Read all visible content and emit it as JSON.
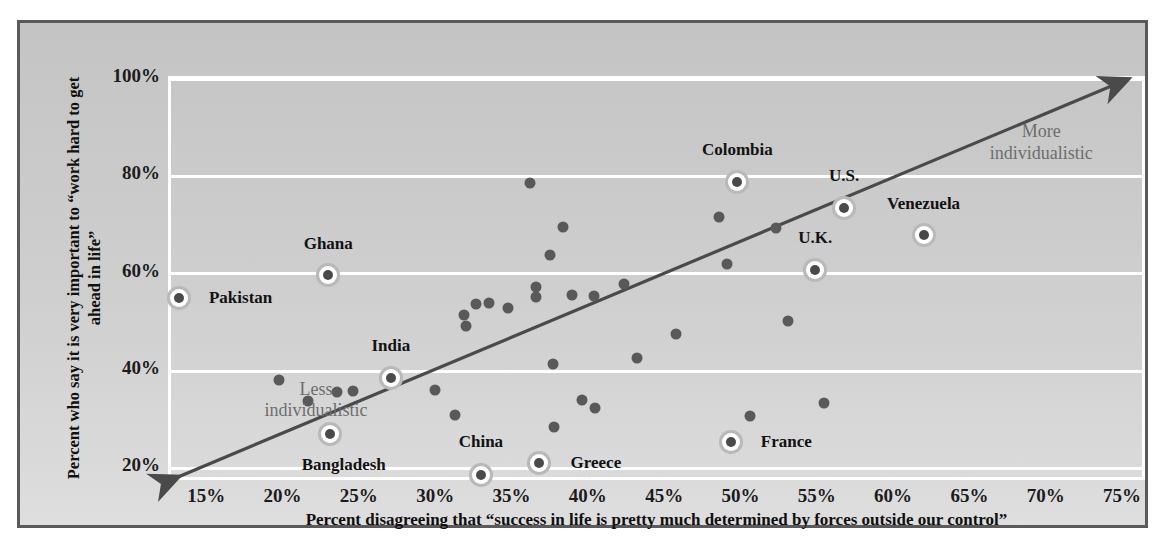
{
  "chart_data": {
    "type": "scatter",
    "title": "",
    "xlabel": "Percent disagreeing that “success in life is pretty much determined by forces outside our control”",
    "ylabel": "Percent who say it is very important to “work hard to get ahead in life”",
    "xlim": [
      12.5,
      76.5
    ],
    "ylim": [
      17.0,
      100.0
    ],
    "xticks": [
      "15%",
      "20%",
      "25%",
      "30%",
      "35%",
      "40%",
      "45%",
      "50%",
      "55%",
      "60%",
      "65%",
      "70%",
      "75%"
    ],
    "xtick_values": [
      15,
      20,
      25,
      30,
      35,
      40,
      45,
      50,
      55,
      60,
      65,
      70,
      75
    ],
    "yticks": [
      "20%",
      "40%",
      "60%",
      "80%",
      "100%"
    ],
    "ytick_values": [
      20,
      40,
      60,
      80,
      100
    ],
    "grid": "horizontal",
    "legend": "none",
    "annotations": [
      {
        "name": "less-individualistic",
        "text": "Less\nindividualistic",
        "x": 22.0,
        "y": 34.0
      },
      {
        "name": "more-individualistic",
        "text": "More\nindividualistic",
        "x": 69.5,
        "y": 87.0
      }
    ],
    "trendline": {
      "name": "diagonal-arrow",
      "x0": 13.0,
      "y0": 18.3,
      "x1": 75.2,
      "y1": 100.0,
      "arrow_start": true,
      "arrow_end": true,
      "color": "#4a4a4a"
    },
    "labeled_points": [
      {
        "label": "Pakistan",
        "x": 13.0,
        "y": 55.0,
        "label_dx": 62,
        "label_dy": 0
      },
      {
        "label": "Ghana",
        "x": 22.8,
        "y": 59.8,
        "label_dx": 0,
        "label_dy": -31
      },
      {
        "label": "Bangladesh",
        "x": 22.9,
        "y": 27.0,
        "label_dx": 14,
        "label_dy": 31
      },
      {
        "label": "India",
        "x": 26.9,
        "y": 38.6,
        "label_dx": 0,
        "label_dy": -32
      },
      {
        "label": "China",
        "x": 32.8,
        "y": 18.6,
        "label_dx": 0,
        "label_dy": -33
      },
      {
        "label": "Greece",
        "x": 36.6,
        "y": 21.2,
        "label_dx": 57,
        "label_dy": 0
      },
      {
        "label": "France",
        "x": 49.2,
        "y": 25.4,
        "label_dx": 55,
        "label_dy": 0
      },
      {
        "label": "Colombia",
        "x": 49.6,
        "y": 78.9,
        "label_dx": 0,
        "label_dy": -32
      },
      {
        "label": "U.K.",
        "x": 54.7,
        "y": 60.7,
        "label_dx": 0,
        "label_dy": -32
      },
      {
        "label": "U.S.",
        "x": 56.6,
        "y": 73.6,
        "label_dx": 0,
        "label_dy": -32
      },
      {
        "label": "Venezuela",
        "x": 61.8,
        "y": 68.0,
        "label_dx": 0,
        "label_dy": -31
      }
    ],
    "unlabeled_points": [
      {
        "x": 19.6,
        "y": 38.1
      },
      {
        "x": 21.5,
        "y": 33.9
      },
      {
        "x": 23.4,
        "y": 35.6
      },
      {
        "x": 24.4,
        "y": 35.8
      },
      {
        "x": 29.8,
        "y": 36.2
      },
      {
        "x": 31.1,
        "y": 30.9
      },
      {
        "x": 31.7,
        "y": 51.6
      },
      {
        "x": 31.8,
        "y": 49.3
      },
      {
        "x": 32.5,
        "y": 53.7
      },
      {
        "x": 33.3,
        "y": 53.9
      },
      {
        "x": 34.6,
        "y": 52.9
      },
      {
        "x": 36.0,
        "y": 78.6
      },
      {
        "x": 36.4,
        "y": 57.2
      },
      {
        "x": 36.4,
        "y": 55.2
      },
      {
        "x": 37.3,
        "y": 63.9
      },
      {
        "x": 37.5,
        "y": 41.4
      },
      {
        "x": 37.6,
        "y": 28.6
      },
      {
        "x": 38.2,
        "y": 69.6
      },
      {
        "x": 38.8,
        "y": 55.6
      },
      {
        "x": 39.4,
        "y": 34.0
      },
      {
        "x": 40.2,
        "y": 55.4
      },
      {
        "x": 40.3,
        "y": 32.5
      },
      {
        "x": 42.2,
        "y": 57.8
      },
      {
        "x": 43.0,
        "y": 42.6
      },
      {
        "x": 45.6,
        "y": 47.7
      },
      {
        "x": 48.4,
        "y": 71.6
      },
      {
        "x": 48.9,
        "y": 61.9
      },
      {
        "x": 50.4,
        "y": 30.8
      },
      {
        "x": 52.1,
        "y": 69.4
      },
      {
        "x": 52.9,
        "y": 50.2
      },
      {
        "x": 55.3,
        "y": 33.4
      }
    ]
  },
  "axes": {
    "x_title": "Percent disagreeing that “success in life is pretty much determined by forces outside our control”",
    "y_title": "Percent who say it is very important to “work hard to get ahead in life”"
  },
  "colors": {
    "panel_background": "#c9c9c9",
    "frame": "#5a5a5a",
    "gridline": "#ffffff",
    "dot": "#595959",
    "highlight_ring": "#ffffff",
    "trendline": "#4a4a4a",
    "annotation_text": "#6e6e6e",
    "label_text": "#121212"
  }
}
